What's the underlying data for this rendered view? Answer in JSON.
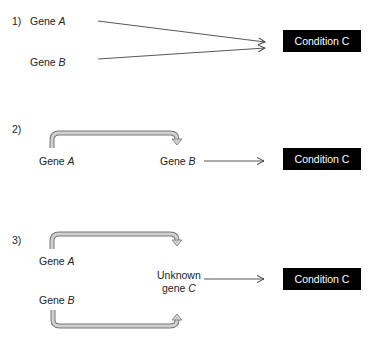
{
  "panels": [
    {
      "number": "1)",
      "gene_a": {
        "prefix": "Gene ",
        "letter": "A"
      },
      "gene_b": {
        "prefix": "Gene ",
        "letter": "B"
      },
      "condition": "Condition C"
    },
    {
      "number": "2)",
      "gene_a": {
        "prefix": "Gene ",
        "letter": "A"
      },
      "gene_b": {
        "prefix": "Gene ",
        "letter": "B"
      },
      "condition": "Condition C"
    },
    {
      "number": "3)",
      "gene_a": {
        "prefix": "Gene ",
        "letter": "A"
      },
      "gene_b": {
        "prefix": "Gene ",
        "letter": "B"
      },
      "unknown_line1": "Unknown",
      "unknown_prefix": "gene ",
      "unknown_letter": "C",
      "condition": "Condition C"
    }
  ],
  "colors": {
    "box_bg": "#000000",
    "box_text": "#ffffff",
    "arrow_line": "#444444",
    "curved_arrow_fill": "#d0d0d0",
    "curved_arrow_stroke": "#777777"
  }
}
